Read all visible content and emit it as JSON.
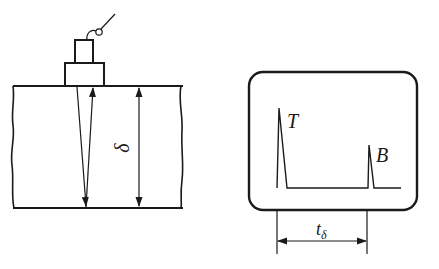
{
  "diagram": {
    "left_panel": {
      "name": "specimen-with-probe",
      "thickness_label": "δ",
      "elements": [
        "probe",
        "probe-cable",
        "specimen-plate",
        "incident-ray",
        "reflected-ray",
        "thickness-dimension"
      ]
    },
    "right_panel": {
      "name": "oscilloscope-screen",
      "echoes": [
        {
          "label": "T",
          "description": "transmitted / initial pulse",
          "peak_x": 279,
          "peak_y": 108
        },
        {
          "label": "B",
          "description": "back-wall echo",
          "peak_x": 369,
          "peak_y": 145
        }
      ],
      "time_label_main": "t",
      "time_label_sub": "δ"
    },
    "colors": {
      "line": "#1a1a1a",
      "background": "#ffffff"
    }
  }
}
